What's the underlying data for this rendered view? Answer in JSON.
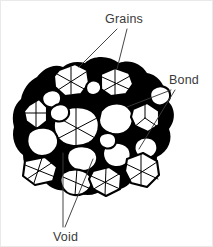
{
  "figure": {
    "background_color": "#ffffff",
    "grain_fill_color": "#ffffff",
    "grain_outline_color": "#000000",
    "void_color": "#000000",
    "label_color": "#3a3a3a",
    "leader_color": "#3b3b3b"
  },
  "callouts": [
    {
      "id": "grains",
      "label": "Grains",
      "text_x": 104,
      "text_y": 22,
      "leaders": 2,
      "description": "Points to two individual grains in the upper part of the cluster"
    },
    {
      "id": "bond",
      "label": "Bond",
      "text_x": 168,
      "text_y": 83,
      "leaders": 2,
      "description": "Points to the narrow necks where adjacent grains are sintered together"
    },
    {
      "id": "void",
      "label": "Void",
      "text_x": 52,
      "text_y": 237,
      "leaders": 2,
      "description": "Points to the black pore space between grains"
    }
  ],
  "grain_count": 19,
  "void_region_label": "void",
  "bond_region_label": "bond"
}
